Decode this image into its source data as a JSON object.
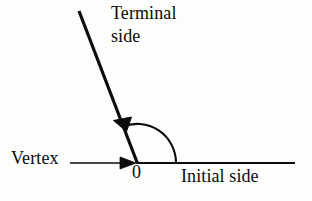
{
  "figure": {
    "kind": "angle-diagram",
    "background_color": "#fdfdfb",
    "ink_color": "#0b0b0b",
    "width": 312,
    "height": 201,
    "labels": {
      "terminal_line1": "Terminal",
      "terminal_line2": "side",
      "vertex": "Vertex",
      "origin": "0",
      "initial": "Initial side"
    },
    "geometry": {
      "vertex_point": [
        137,
        163
      ],
      "initial_side_end": [
        295,
        163
      ],
      "terminal_side_end": [
        79,
        11
      ],
      "arc_radius": 39,
      "arc_start_point": [
        176,
        163
      ],
      "arc_end_point": [
        118,
        121
      ],
      "pointer_start": [
        70,
        163
      ],
      "pointer_tip": [
        136,
        163
      ],
      "angle_degrees": 111
    }
  }
}
